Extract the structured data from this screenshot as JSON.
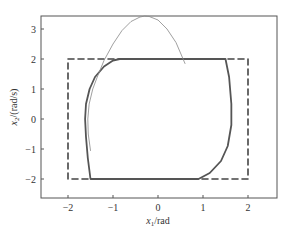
{
  "chart_data": {
    "type": "line",
    "title": "",
    "xlabel": "x1/rad",
    "ylabel": "x2/(rad/s)",
    "xlim": [
      -2.6,
      2.64
    ],
    "ylim": [
      -2.63,
      3.43
    ],
    "xticks": [
      -2,
      -1,
      0,
      1,
      2
    ],
    "yticks": [
      -2,
      -1,
      0,
      1,
      2,
      3
    ],
    "xtick_labels": [
      "−2",
      "−1",
      "0",
      "1",
      "2"
    ],
    "ytick_labels": [
      "−2",
      "−1",
      "0",
      "1",
      "2",
      "3"
    ],
    "grid": false,
    "legend": null,
    "series": [
      {
        "name": "constraint boundary",
        "style": "dashed",
        "color": "#444444",
        "x": [
          -2,
          2,
          2,
          -2,
          -2
        ],
        "y": [
          2,
          2,
          -2,
          -2,
          2
        ]
      },
      {
        "name": "trajectory (thick)",
        "style": "solid",
        "color": "#555555",
        "x": [
          -0.85,
          0.0,
          1.0,
          1.5,
          1.58,
          1.63,
          1.63,
          1.55,
          1.4,
          1.15,
          0.9,
          0.0,
          -1.0,
          -1.5,
          -1.56,
          -1.6,
          -1.62,
          -1.6,
          -1.52,
          -1.4,
          -1.2,
          -1.0,
          -0.85
        ],
        "y": [
          2.0,
          2.0,
          2.0,
          2.0,
          1.4,
          0.5,
          -0.2,
          -0.9,
          -1.4,
          -1.8,
          -2.0,
          -2.0,
          -2.0,
          -2.0,
          -1.3,
          -0.6,
          0.0,
          0.5,
          1.0,
          1.4,
          1.75,
          1.95,
          2.0
        ]
      },
      {
        "name": "trajectory (thin)",
        "style": "solid",
        "color": "#888888",
        "x": [
          -1.5,
          -1.55,
          -1.56,
          -1.53,
          -1.45,
          -1.35,
          -1.2,
          -1.0,
          -0.8,
          -0.6,
          -0.4,
          -0.3,
          -0.2,
          0.0,
          0.2,
          0.4,
          0.5,
          0.6
        ],
        "y": [
          -1.05,
          -0.5,
          0.0,
          0.5,
          1.0,
          1.4,
          1.95,
          2.5,
          2.95,
          3.25,
          3.4,
          3.43,
          3.42,
          3.3,
          3.0,
          2.55,
          2.2,
          1.85
        ]
      }
    ]
  },
  "axes": {
    "xlabel_main": "x",
    "xlabel_sub": "1",
    "xlabel_unit": "/rad",
    "ylabel_main": "x",
    "ylabel_sub": "2",
    "ylabel_unit": "/(rad/s)"
  }
}
